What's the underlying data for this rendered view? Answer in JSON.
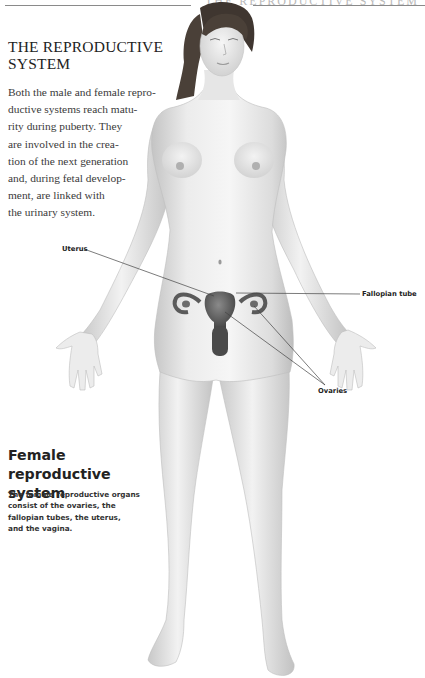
{
  "page": {
    "running_head": "THE REPRODUCTIVE SYSTEM"
  },
  "intro": {
    "title_lines": [
      "THE REPRODUCTIVE",
      "SYSTEM"
    ],
    "body_lines": [
      "Both the male and female repro-",
      "ductive systems reach matu-",
      "rity during puberty. They",
      "are involved in the crea-",
      "tion of the next generation",
      "and, during fetal develop-",
      "ment, are linked with",
      "the urinary system."
    ]
  },
  "figure": {
    "labels": {
      "uterus": "Uterus",
      "fallopian_tube": "Fallopian tube",
      "ovaries": "Ovaries"
    },
    "colors": {
      "skin_light": "#f2f2f2",
      "skin_mid": "#d9d9d9",
      "skin_shadow": "#b5b5b5",
      "hair": "#4a4038",
      "organ": "#555555",
      "leader_line": "#444444"
    }
  },
  "section": {
    "heading_lines": [
      "Female reproductive",
      "system"
    ],
    "caption_lines": [
      "The female reproductive organs",
      "consist of the ovaries, the",
      "fallopian tubes, the uterus,",
      "and the vagina."
    ]
  }
}
